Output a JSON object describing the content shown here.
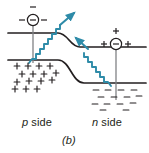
{
  "figure": {
    "panel_label": "(b)",
    "caption_kind": "pn-junction-band-diagram-photon-emission"
  },
  "labels": {
    "p_side_italic": "p",
    "p_side_rest": " side",
    "n_side_italic": "n",
    "n_side_rest": " side"
  },
  "colors": {
    "band_line": "#231f20",
    "vertical_line": "#808285",
    "photon_arrow": "#2e8ba8",
    "charge_symbol": "#231f20",
    "background": "#ffffff"
  },
  "bands": {
    "conduction": {
      "p_level_y": 33,
      "n_level_y": 47,
      "label": "upper-band-edge"
    },
    "valence": {
      "p_level_y": 60,
      "n_level_y": 83,
      "label": "lower-band-edge"
    },
    "junction_x_start": 58,
    "junction_x_end": 92
  },
  "carriers": {
    "p_side_electron": {
      "cx": 33,
      "cy": 20,
      "inner_symbol": "−",
      "flank_left": "−",
      "flank_right": "−",
      "above": "−",
      "name": "electron"
    },
    "n_side_hole": {
      "cx": 116,
      "cy": 44,
      "inner_symbol": "−",
      "flank_left": "+",
      "flank_right": "+",
      "above": "+",
      "name": "recombination-center"
    }
  },
  "charge_clouds": {
    "p_side_positive": {
      "symbol": "+",
      "count": 15,
      "points": [
        [
          17,
          66
        ],
        [
          28,
          66
        ],
        [
          39,
          66
        ],
        [
          50,
          66
        ],
        [
          22,
          74
        ],
        [
          33,
          74
        ],
        [
          44,
          74
        ],
        [
          56,
          73
        ],
        [
          17,
          82
        ],
        [
          29,
          81
        ],
        [
          41,
          81
        ],
        [
          52,
          80
        ],
        [
          15,
          89
        ],
        [
          26,
          89
        ],
        [
          37,
          89
        ]
      ]
    },
    "n_side_negative": {
      "symbol": "−",
      "count": 14,
      "points": [
        [
          96,
          90
        ],
        [
          108,
          90
        ],
        [
          121,
          90
        ],
        [
          134,
          90
        ],
        [
          101,
          97
        ],
        [
          114,
          97
        ],
        [
          127,
          97
        ],
        [
          139,
          96
        ],
        [
          95,
          104
        ],
        [
          107,
          104
        ],
        [
          120,
          104
        ],
        [
          133,
          103
        ],
        [
          103,
          110
        ],
        [
          126,
          110
        ]
      ]
    }
  },
  "photons": [
    {
      "name": "photon-emitted-p-side",
      "direction": "up-right",
      "start": [
        30,
        62
      ],
      "end": [
        73,
        14
      ]
    },
    {
      "name": "photon-emitted-n-side",
      "direction": "up-left",
      "start": [
        110,
        85
      ],
      "end": [
        76,
        38
      ]
    }
  ],
  "vertical_lines": [
    {
      "name": "p-side-transition-line",
      "x": 33,
      "y1": 22,
      "y2": 63
    },
    {
      "name": "n-side-transition-line",
      "x": 116,
      "y1": 46,
      "y2": 100
    }
  ]
}
